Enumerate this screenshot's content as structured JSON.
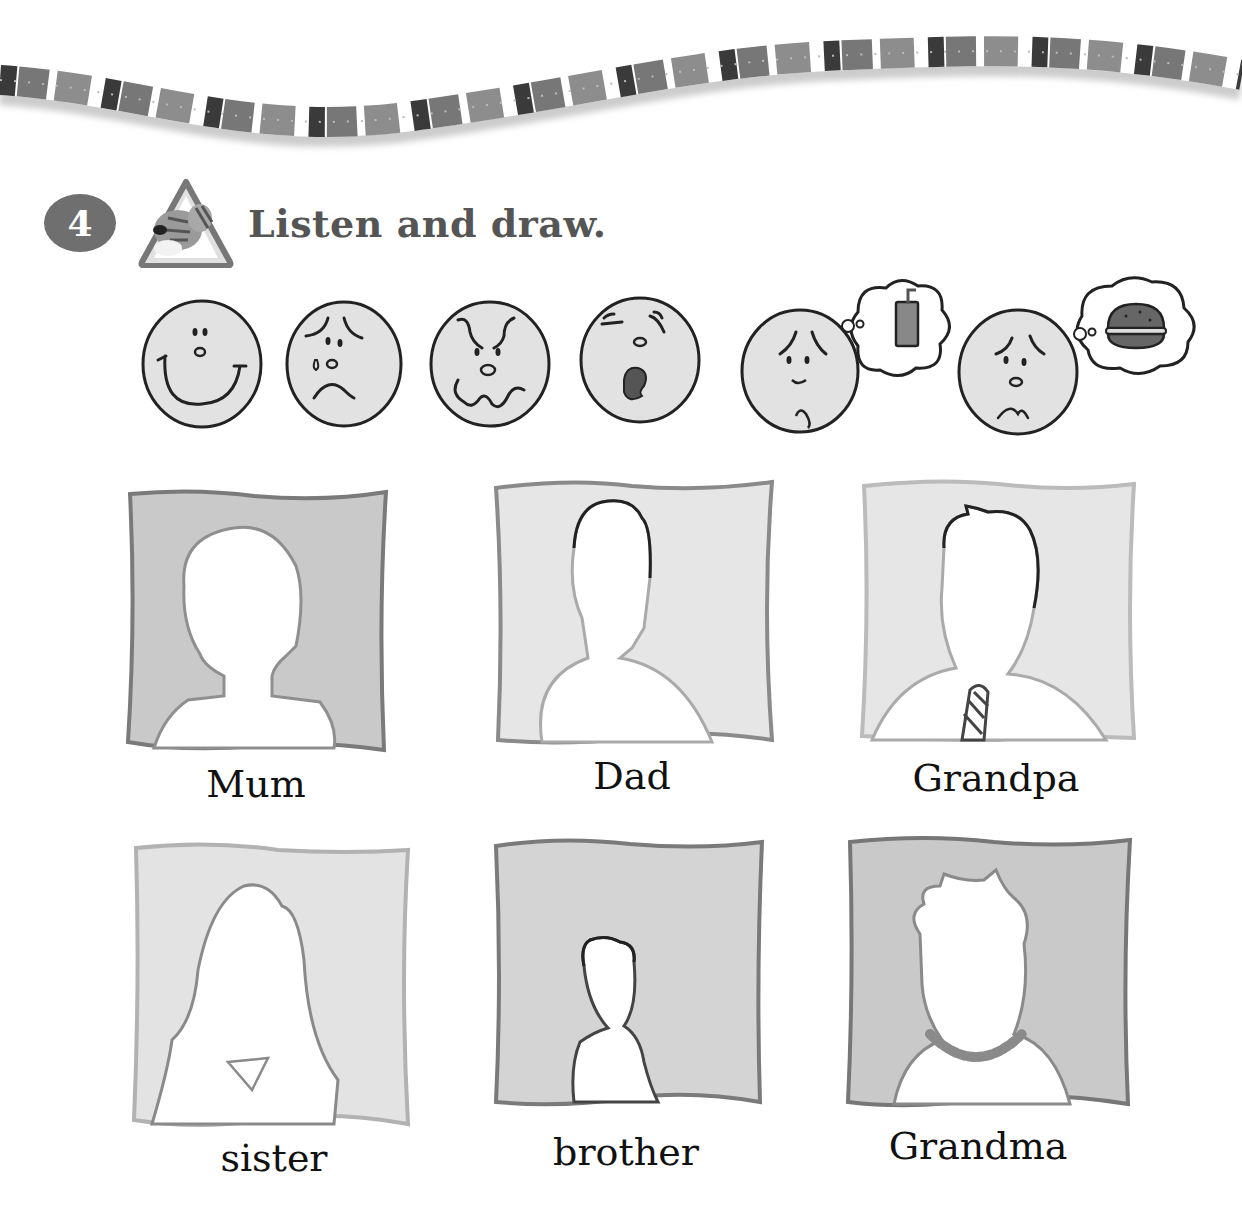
{
  "exercise": {
    "number": "4",
    "icon": "tiger-listen-icon",
    "instruction": "Listen and draw."
  },
  "faces": [
    {
      "name": "happy",
      "icon": "happy-face-icon"
    },
    {
      "name": "sad",
      "icon": "crying-face-icon"
    },
    {
      "name": "angry",
      "icon": "angry-face-icon"
    },
    {
      "name": "tired",
      "icon": "yawning-face-icon"
    },
    {
      "name": "thirsty",
      "icon": "thirsty-face-icon",
      "thought": "drink-icon"
    },
    {
      "name": "hungry",
      "icon": "hungry-face-icon",
      "thought": "burger-icon"
    }
  ],
  "portraits": [
    {
      "label": "Mum"
    },
    {
      "label": "Dad"
    },
    {
      "label": "Grandpa"
    },
    {
      "label": "sister"
    },
    {
      "label": "brother"
    },
    {
      "label": "Grandma"
    }
  ],
  "colors": {
    "badge": "#6f6f6f",
    "title": "#555555",
    "face_fill": "#e2e2e2",
    "frame_dark": "#c9c9c9",
    "frame_light": "#e6e6e6"
  }
}
